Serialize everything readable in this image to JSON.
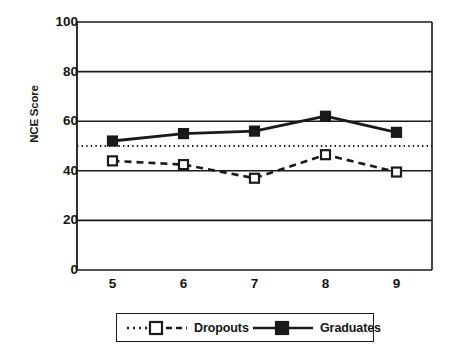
{
  "chart_data": {
    "type": "line",
    "title": "",
    "xlabel": "",
    "ylabel": "NCE Score",
    "categories": [
      "5",
      "6",
      "7",
      "8",
      "9"
    ],
    "x": [
      5,
      6,
      7,
      8,
      9
    ],
    "ylim": [
      0,
      100
    ],
    "xtick_labels": [
      "5",
      "6",
      "7",
      "8",
      "9"
    ],
    "ytick_labels": [
      "0",
      "20",
      "40",
      "60",
      "80",
      "100"
    ],
    "ytick_values": [
      0,
      20,
      40,
      60,
      80,
      100
    ],
    "grid": "horizontal",
    "legend_position": "bottom",
    "reference_line": {
      "value": 50,
      "style": "dotted",
      "color": "#1a1a1a"
    },
    "series": [
      {
        "name": "Dropouts",
        "values": [
          44,
          42.5,
          37,
          46.5,
          39.5
        ],
        "line_style": "dashed",
        "marker": "open-square",
        "color": "#1a1a1a"
      },
      {
        "name": "Graduates",
        "values": [
          52,
          55,
          56,
          62,
          55.5
        ],
        "line_style": "solid",
        "marker": "filled-square",
        "color": "#1a1a1a"
      }
    ]
  },
  "axis": {
    "y_title": "NCE Score"
  },
  "legend": {
    "items": [
      {
        "label": "Dropouts"
      },
      {
        "label": "Graduates"
      }
    ]
  },
  "colors": {
    "line": "#1a1a1a",
    "background": "#ffffff",
    "grid": "#1a1a1a"
  }
}
